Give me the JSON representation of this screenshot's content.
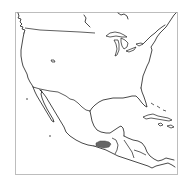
{
  "map": {
    "region": "North America, Mexico, Central America and Caribbean",
    "projection_frame": {
      "x": 15,
      "y": 12,
      "width": 162,
      "height": 162
    },
    "colors": {
      "background": "#ffffff",
      "frame": "#bdbdbd",
      "coastline": "#1a1a1a",
      "highlight_fill": "#666666"
    },
    "highlighted_region": {
      "description": "shaded area in southern Mexico",
      "fill": "#666666"
    }
  }
}
